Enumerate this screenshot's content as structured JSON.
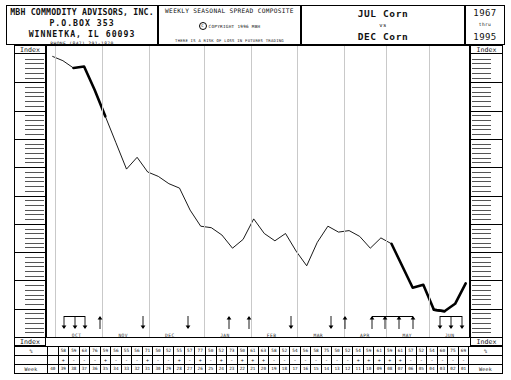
{
  "header": {
    "company": {
      "name": "MBH COMMODITY ADVISORS, INC.",
      "box": "P.O.BOX 353",
      "city": "WINNETKA, IL  60093",
      "phone": "PHONE (847) 291-1870"
    },
    "center": {
      "title": "WEEKLY SEASONAL SPREAD COMPOSITE",
      "copyright_mark": "C",
      "copyright": "COPYRIGHT 1996 MBH",
      "disclaimer": "THERE IS A RISK OF LOSS IN FUTURES TRADING"
    },
    "spread": {
      "leg1": "JUL Corn",
      "vs": "vs",
      "leg2": "DEC Corn"
    },
    "years": {
      "from": "1967",
      "thru": "thru",
      "to": "1995"
    }
  },
  "axis": {
    "top_left_label": "Index",
    "top_right_label": "Index",
    "bottom_left_label": "Index",
    "bottom_right_label": "Index",
    "major_divisions": 10,
    "minor_per_major": 5
  },
  "table": {
    "row_labels": {
      "percent": "%",
      "week": "Week"
    },
    "percent": [
      "",
      "58",
      "59",
      "63",
      "76",
      "59",
      "56",
      "55",
      "56",
      "71",
      "50",
      "52",
      "55",
      "57",
      "77",
      "50",
      "52",
      "73",
      "50",
      "61",
      "63",
      "58",
      "52",
      "54",
      "56",
      "58",
      "75",
      "50",
      "52",
      "54",
      "59",
      "61",
      "59",
      "61",
      "57",
      "52",
      "54",
      "60",
      "75",
      "69"
    ],
    "sign": [
      "",
      "+",
      "-",
      "-",
      "-",
      "+",
      "-",
      "-",
      "-",
      "+",
      "-",
      "-",
      "+",
      "-",
      "+",
      "-",
      "+",
      "-",
      "+",
      "+",
      "+",
      "-",
      "-",
      "-",
      "-",
      "-",
      "-",
      "-",
      "-",
      "+",
      "+",
      "+",
      "+",
      "+",
      "-",
      "-",
      "-",
      "-",
      "-",
      "-"
    ],
    "week": [
      "40",
      "39",
      "38",
      "37",
      "36",
      "35",
      "34",
      "33",
      "32",
      "31",
      "30",
      "29",
      "28",
      "27",
      "26",
      "25",
      "24",
      "23",
      "22",
      "21",
      "20",
      "19",
      "18",
      "17",
      "16",
      "15",
      "14",
      "13",
      "12",
      "11",
      "10",
      "09",
      "08",
      "07",
      "06",
      "05",
      "04",
      "03",
      "02",
      "01"
    ]
  },
  "months": [
    {
      "label": "OCT",
      "pos": 0.075
    },
    {
      "label": "NOV",
      "pos": 0.185
    },
    {
      "label": "DEC",
      "pos": 0.295
    },
    {
      "label": "JAN",
      "pos": 0.425
    },
    {
      "label": "FEB",
      "pos": 0.535
    },
    {
      "label": "MAR",
      "pos": 0.645
    },
    {
      "label": "APR",
      "pos": 0.755
    },
    {
      "label": "MAY",
      "pos": 0.855
    },
    {
      "label": "JUN",
      "pos": 0.955
    }
  ],
  "arrows": [
    {
      "dir": "down",
      "pos": 0.043
    },
    {
      "dir": "down",
      "pos": 0.068
    },
    {
      "dir": "down",
      "pos": 0.093
    },
    {
      "dir": "up",
      "pos": 0.128
    },
    {
      "dir": "down",
      "pos": 0.228
    },
    {
      "dir": "down",
      "pos": 0.335
    },
    {
      "dir": "up",
      "pos": 0.432
    },
    {
      "dir": "up",
      "pos": 0.478
    },
    {
      "dir": "down",
      "pos": 0.578
    },
    {
      "dir": "down",
      "pos": 0.672
    },
    {
      "dir": "up",
      "pos": 0.705
    },
    {
      "dir": "up",
      "pos": 0.768
    },
    {
      "dir": "up",
      "pos": 0.8
    },
    {
      "dir": "up",
      "pos": 0.833
    },
    {
      "dir": "up",
      "pos": 0.865
    },
    {
      "dir": "down",
      "pos": 0.93
    },
    {
      "dir": "down",
      "pos": 0.955
    },
    {
      "dir": "down",
      "pos": 0.98
    }
  ],
  "chart_data": {
    "type": "line",
    "subtitle": "1967 thru 1995",
    "xlabel": "Week",
    "ylabel": "Index",
    "grid": "vertical-monthly",
    "legend": "none",
    "x": [
      "40",
      "39",
      "38",
      "37",
      "36",
      "35",
      "34",
      "33",
      "32",
      "31",
      "30",
      "29",
      "28",
      "27",
      "26",
      "25",
      "24",
      "23",
      "22",
      "21",
      "20",
      "19",
      "18",
      "17",
      "16",
      "15",
      "14",
      "13",
      "12",
      "11",
      "10",
      "09",
      "08",
      "07",
      "06",
      "05",
      "04",
      "03",
      "02",
      "01"
    ],
    "ylim": [
      0,
      100
    ],
    "values": [
      96.5,
      95.0,
      92.5,
      93.0,
      85.0,
      76.0,
      67.0,
      58.0,
      62.0,
      57.0,
      55.5,
      53.0,
      51.5,
      44.0,
      38.5,
      38.0,
      35.5,
      31.0,
      34.0,
      41.0,
      36.0,
      33.5,
      36.0,
      30.0,
      25.0,
      33.0,
      38.5,
      36.5,
      37.0,
      35.0,
      31.0,
      34.5,
      32.5,
      25.0,
      17.5,
      18.5,
      10.0,
      9.5,
      12.0,
      19.0
    ],
    "bold_segments": [
      [
        2,
        5
      ],
      [
        32,
        37
      ],
      [
        36,
        39
      ]
    ],
    "bold_note": "heavy-weight line segments marking the seasonal decline and the spring rally/break"
  }
}
